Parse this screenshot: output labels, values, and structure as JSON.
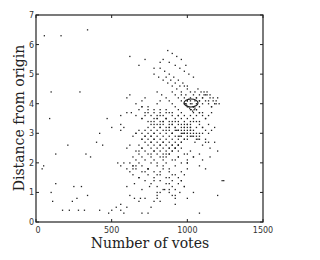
{
  "chart_data": {
    "type": "scatter",
    "title": "",
    "xlabel": "Number of votes",
    "ylabel": "Distance from origin",
    "xlim": [
      0,
      1500
    ],
    "ylim": [
      0,
      7
    ],
    "xticks": [
      0,
      500,
      1000,
      1500
    ],
    "xtick_labels": [
      "0",
      "500",
      "1000",
      "1500"
    ],
    "yticks": [
      0,
      1,
      2,
      3,
      4,
      5,
      6,
      7
    ],
    "ytick_labels": [
      "0",
      "1",
      "2",
      "3",
      "4",
      "5",
      "6",
      "7"
    ],
    "grid": false,
    "legend": null,
    "marker": "dot",
    "marker_color": "#222222",
    "annotation": "ring-shaped marker near (1020, 4.0)",
    "series": [
      {
        "name": "points",
        "x": [
          165,
          55,
          340,
          290,
          100,
          560,
          470,
          500,
          630,
          560,
          600,
          420,
          400,
          440,
          330,
          360,
          90,
          130,
          40,
          50,
          210,
          100,
          130,
          250,
          270,
          240,
          300,
          340,
          110,
          175,
          220,
          280,
          320,
          420,
          480,
          500,
          530,
          560,
          580,
          600,
          650,
          690,
          700,
          740,
          760,
          780,
          800,
          820,
          880,
          920,
          960,
          1000,
          1040,
          1080,
          1100,
          1120,
          1150,
          1180,
          1200,
          1230,
          870,
          900,
          930,
          960,
          990,
          840,
          880,
          920,
          950,
          980,
          1010,
          1040,
          820,
          850,
          880,
          910,
          940,
          970,
          1000,
          860,
          890,
          920,
          950,
          780,
          810,
          840,
          870,
          900,
          930,
          960,
          990,
          1020,
          1050,
          800,
          830,
          860,
          900,
          920,
          940,
          960,
          980,
          1000,
          1020,
          1040,
          1060,
          1080,
          1100,
          1120,
          1140,
          1160,
          880,
          900,
          920,
          940,
          960,
          980,
          1000,
          1020,
          1040,
          1060,
          1080,
          1100,
          1120,
          1140,
          860,
          880,
          900,
          920,
          940,
          960,
          980,
          1000,
          1020,
          1040,
          1060,
          1080,
          1100,
          820,
          840,
          860,
          880,
          900,
          920,
          940,
          960,
          980,
          1000,
          1020,
          1040,
          1060,
          1080,
          800,
          820,
          840,
          860,
          880,
          900,
          920,
          940,
          960,
          980,
          1000,
          1020,
          1040,
          780,
          800,
          820,
          840,
          860,
          880,
          900,
          920,
          940,
          960,
          980,
          1000,
          760,
          780,
          800,
          820,
          840,
          860,
          880,
          900,
          920,
          940,
          960,
          980,
          740,
          760,
          780,
          800,
          820,
          840,
          860,
          880,
          900,
          920,
          940,
          720,
          740,
          760,
          780,
          800,
          820,
          840,
          860,
          880,
          900,
          920,
          700,
          720,
          740,
          760,
          780,
          800,
          820,
          840,
          860,
          880,
          700,
          720,
          740,
          760,
          780,
          800,
          820,
          840,
          860,
          900,
          940,
          980,
          1020,
          680,
          700,
          720,
          740,
          760,
          780,
          800,
          840,
          880,
          920,
          960,
          1000,
          1040,
          1080,
          660,
          680,
          700,
          720,
          760,
          800,
          840,
          880,
          920,
          960,
          1000,
          640,
          660,
          680,
          700,
          740,
          780,
          820,
          860,
          900,
          940,
          980,
          620,
          640,
          660,
          700,
          740,
          780,
          820,
          860,
          900,
          940,
          600,
          620,
          640,
          680,
          720,
          760,
          800,
          840,
          880,
          920,
          980,
          700,
          740,
          780,
          820,
          860,
          900,
          940,
          980,
          1020,
          1060,
          680,
          720,
          760,
          800,
          840,
          880,
          920,
          960,
          1000,
          660,
          700,
          740,
          780,
          820,
          860,
          900,
          940,
          990,
          1000,
          1010,
          1020,
          1030,
          1040,
          1050,
          1045,
          1035,
          1025,
          1015,
          1005,
          995,
          990,
          1060,
          1080,
          1100,
          1120,
          1140,
          1160,
          1180,
          1200,
          1110,
          1130,
          1150,
          1170,
          1190,
          1080,
          1100,
          1120,
          1140,
          1160,
          1050,
          1070,
          1090,
          1110,
          1130,
          1150,
          1170,
          1190,
          1210,
          1060,
          1080,
          1100,
          1120,
          1140,
          1160,
          1180,
          1020,
          1040,
          1060,
          1080,
          1100,
          1120,
          1140,
          980,
          1000,
          1020,
          1040,
          1060,
          1080,
          1100,
          960,
          980,
          1000,
          1020,
          1040,
          1060,
          1080,
          940,
          960,
          980,
          1000,
          1020,
          1040,
          900,
          950,
          1000,
          1050,
          1100,
          1150,
          920,
          970,
          1020,
          1070,
          1120,
          880,
          930,
          980,
          1030,
          1080,
          700,
          760,
          820,
          880,
          940,
          1000,
          1060,
          720,
          780,
          840,
          900,
          960,
          1020,
          740,
          800,
          860,
          920,
          980,
          640,
          700,
          760,
          820,
          880,
          940,
          1000,
          660,
          720,
          780,
          840,
          900,
          960,
          600,
          680,
          760,
          840,
          920,
          1000,
          620,
          700,
          780,
          860,
          940,
          560,
          640,
          720,
          800,
          880,
          960,
          580,
          660,
          740,
          820,
          900,
          600,
          700,
          800,
          900,
          1000,
          650,
          750,
          850,
          950,
          620,
          720,
          820,
          920,
          680,
          780,
          880,
          980,
          560,
          680,
          800,
          920,
          1040,
          1240,
          1080,
          1200,
          700,
          780,
          860,
          940,
          660,
          740,
          820,
          900,
          600,
          700,
          800,
          620,
          720,
          820,
          560,
          660,
          760,
          580,
          680,
          780,
          540,
          640,
          740,
          620,
          720,
          820,
          680,
          780
        ],
        "y": [
          6.3,
          6.3,
          6.5,
          4.4,
          4.4,
          3.3,
          3.5,
          3.2,
          3.7,
          3.6,
          3.7,
          3.0,
          2.7,
          2.6,
          2.3,
          2.2,
          3.5,
          2.3,
          1.8,
          1.9,
          2.6,
          1.0,
          1.3,
          1.2,
          0.8,
          0.7,
          1.2,
          0.9,
          0.7,
          0.4,
          0.4,
          0.4,
          0.4,
          0.4,
          0.3,
          0.4,
          0.5,
          0.4,
          0.3,
          0.5,
          0.8,
          0.8,
          0.3,
          0.3,
          0.5,
          0.7,
          0.9,
          1.0,
          1.1,
          0.8,
          1.4,
          2.0,
          2.2,
          1.9,
          2.1,
          1.8,
          2.2,
          2.7,
          2.4,
          1.4,
          5.8,
          5.7,
          5.6,
          5.5,
          5.3,
          5.5,
          5.4,
          5.3,
          5.2,
          5.1,
          5.0,
          4.9,
          5.2,
          5.1,
          5.0,
          4.9,
          4.8,
          4.7,
          4.6,
          4.9,
          4.8,
          4.7,
          4.6,
          5.0,
          4.9,
          4.8,
          4.7,
          4.6,
          4.5,
          4.4,
          4.3,
          4.2,
          4.1,
          4.4,
          4.3,
          4.2,
          4.4,
          4.3,
          4.2,
          4.1,
          4.0,
          3.9,
          3.8,
          3.9,
          4.0,
          4.1,
          4.2,
          4.3,
          4.1,
          3.9,
          4.1,
          4.0,
          3.9,
          3.8,
          3.7,
          3.6,
          3.5,
          3.6,
          3.7,
          3.8,
          3.9,
          3.7,
          3.5,
          3.3,
          3.8,
          3.7,
          3.6,
          3.5,
          3.4,
          3.3,
          3.2,
          3.3,
          3.4,
          3.5,
          3.6,
          3.4,
          3.2,
          3.7,
          3.6,
          3.5,
          3.4,
          3.3,
          3.2,
          3.1,
          3.0,
          3.1,
          3.2,
          3.3,
          3.4,
          3.2,
          3.0,
          3.5,
          3.4,
          3.3,
          3.2,
          3.1,
          3.0,
          2.9,
          2.8,
          2.9,
          3.0,
          3.1,
          3.2,
          3.0,
          3.4,
          3.3,
          3.2,
          3.1,
          3.0,
          2.9,
          2.8,
          2.7,
          2.6,
          2.7,
          2.8,
          2.9,
          3.3,
          3.2,
          3.1,
          3.0,
          2.9,
          2.8,
          2.7,
          2.6,
          2.5,
          2.6,
          2.7,
          2.8,
          3.2,
          3.1,
          3.0,
          2.9,
          2.8,
          2.7,
          2.6,
          2.5,
          2.4,
          2.5,
          2.6,
          3.1,
          3.0,
          2.9,
          2.8,
          2.7,
          2.6,
          2.5,
          2.4,
          2.3,
          2.4,
          2.5,
          3.0,
          2.9,
          2.8,
          2.7,
          2.6,
          2.5,
          2.4,
          2.3,
          2.2,
          2.3,
          2.8,
          2.7,
          2.6,
          2.5,
          2.4,
          2.3,
          2.2,
          2.1,
          2.0,
          2.1,
          2.2,
          2.3,
          2.4,
          2.6,
          2.5,
          2.4,
          2.3,
          2.2,
          2.1,
          2.0,
          1.9,
          1.8,
          1.9,
          2.0,
          2.1,
          2.2,
          2.3,
          2.4,
          2.3,
          2.2,
          2.1,
          2.0,
          1.9,
          1.8,
          1.7,
          1.6,
          1.7,
          1.8,
          2.2,
          2.1,
          2.0,
          1.9,
          1.8,
          1.7,
          1.6,
          1.5,
          1.4,
          1.5,
          1.6,
          2.0,
          1.9,
          1.8,
          1.7,
          1.6,
          1.5,
          1.4,
          1.3,
          1.2,
          1.3,
          1.8,
          1.7,
          1.6,
          1.5,
          1.4,
          1.3,
          1.2,
          1.1,
          1.0,
          1.1,
          1.2,
          3.9,
          3.8,
          3.7,
          3.6,
          3.5,
          3.4,
          3.3,
          3.2,
          3.1,
          3.0,
          3.8,
          3.7,
          3.6,
          3.5,
          3.4,
          3.3,
          3.2,
          3.1,
          3.0,
          3.6,
          3.5,
          3.4,
          3.3,
          3.2,
          3.1,
          3.0,
          2.9,
          4.0,
          4.1,
          4.15,
          4.1,
          4.0,
          3.9,
          3.85,
          3.8,
          3.75,
          3.8,
          3.85,
          3.9,
          3.95,
          4.0,
          4.2,
          4.3,
          4.2,
          4.1,
          4.0,
          3.9,
          4.0,
          4.2,
          4.4,
          4.3,
          4.2,
          4.1,
          4.0,
          3.7,
          3.6,
          3.5,
          3.6,
          3.7,
          4.4,
          4.5,
          4.4,
          4.3,
          4.4,
          4.3,
          4.2,
          4.1,
          4.0,
          3.4,
          3.3,
          3.2,
          3.1,
          3.0,
          3.1,
          3.2,
          3.0,
          2.9,
          2.8,
          2.9,
          3.0,
          2.8,
          2.7,
          4.6,
          4.5,
          4.4,
          4.3,
          4.2,
          4.1,
          4.0,
          4.3,
          4.2,
          4.1,
          4.0,
          3.9,
          3.8,
          3.7,
          3.6,
          3.5,
          3.4,
          3.3,
          3.2,
          3.1,
          3.0,
          2.9,
          2.8,
          2.7,
          2.6,
          2.5,
          3.1,
          3.0,
          2.9,
          2.8,
          2.7,
          3.2,
          3.1,
          3.0,
          2.9,
          2.8,
          3.5,
          3.4,
          3.3,
          3.2,
          3.1,
          3.0,
          2.9,
          3.6,
          3.5,
          3.4,
          3.3,
          3.2,
          3.1,
          3.7,
          3.6,
          3.5,
          3.4,
          3.3,
          2.9,
          2.8,
          2.7,
          2.6,
          2.5,
          2.4,
          2.3,
          3.0,
          2.9,
          2.8,
          2.7,
          2.6,
          2.5,
          2.5,
          2.4,
          2.3,
          2.2,
          2.1,
          2.0,
          2.6,
          2.5,
          2.4,
          2.3,
          2.2,
          1.9,
          1.8,
          1.7,
          1.6,
          1.5,
          1.4,
          2.0,
          1.9,
          1.8,
          1.7,
          1.6,
          1.2,
          1.1,
          1.0,
          0.9,
          0.8,
          1.3,
          1.2,
          1.1,
          1.0,
          0.9,
          0.8,
          0.7,
          0.6,
          1.5,
          1.4,
          1.3,
          1.2,
          0.6,
          0.7,
          0.8,
          0.9,
          1.0,
          1.4,
          0.3,
          0.9,
          3.9,
          3.8,
          3.7,
          3.6,
          4.0,
          3.9,
          3.8,
          3.7,
          4.2,
          4.1,
          4.0,
          4.3,
          4.2,
          4.1,
          3.1,
          3.0,
          2.9,
          3.2,
          3.1,
          3.0,
          2.0,
          1.9,
          1.8,
          5.6,
          5.5,
          5.4,
          5.3,
          5.2
        ]
      }
    ]
  },
  "axes": {
    "xlabel": "Number of votes",
    "ylabel": "Distance from origin",
    "xtick_labels": [
      "0",
      "500",
      "1000",
      "1500"
    ],
    "ytick_labels": [
      "0",
      "1",
      "2",
      "3",
      "4",
      "5",
      "6",
      "7"
    ]
  }
}
